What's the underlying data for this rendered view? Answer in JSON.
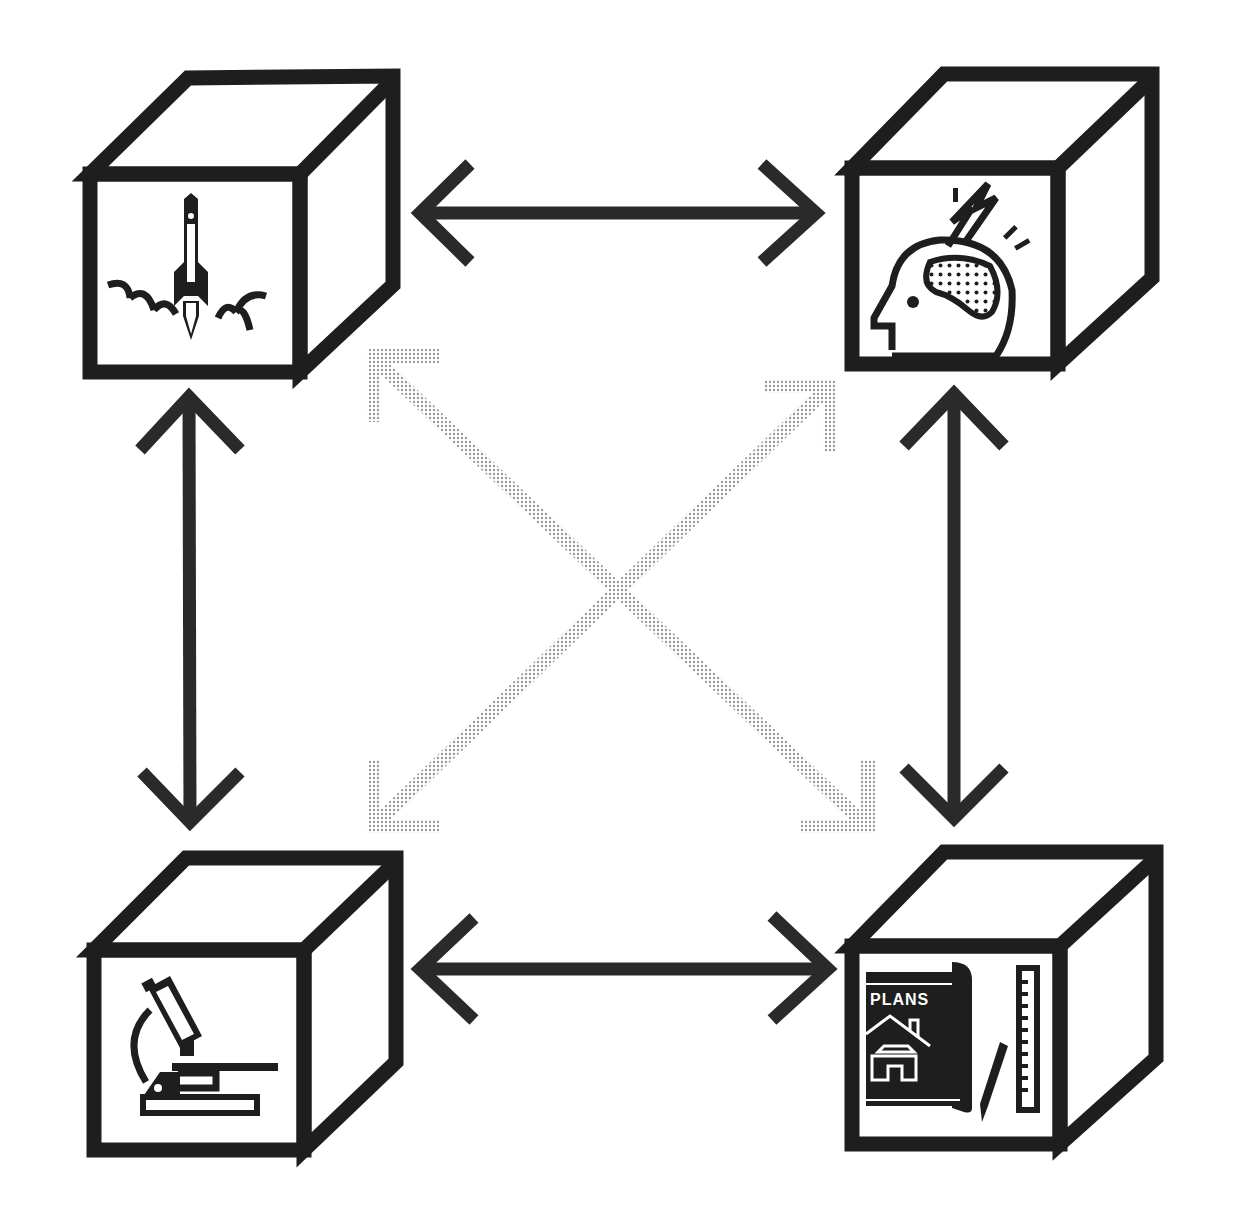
{
  "diagram": {
    "type": "four interconnected cubes",
    "background": "#ffffff",
    "colors": {
      "stroke": "#1e1e1e",
      "arrow": "#2a2a2a",
      "dotted_arrow": "#b0b0b0"
    },
    "nodes": [
      {
        "id": "top-left",
        "icon": "rocket-launch-icon"
      },
      {
        "id": "top-right",
        "icon": "head-brain-lightning-icon"
      },
      {
        "id": "bottom-left",
        "icon": "microscope-icon"
      },
      {
        "id": "bottom-right",
        "icon": "blueprint-plans-icon",
        "label": "PLANS"
      }
    ],
    "connections": [
      {
        "from": "top-left",
        "to": "top-right",
        "style": "solid",
        "direction": "bidirectional"
      },
      {
        "from": "bottom-left",
        "to": "bottom-right",
        "style": "solid",
        "direction": "bidirectional"
      },
      {
        "from": "top-left",
        "to": "bottom-left",
        "style": "solid",
        "direction": "bidirectional"
      },
      {
        "from": "top-right",
        "to": "bottom-right",
        "style": "solid",
        "direction": "bidirectional"
      },
      {
        "from": "top-left",
        "to": "bottom-right",
        "style": "dotted",
        "direction": "bidirectional"
      },
      {
        "from": "top-right",
        "to": "bottom-left",
        "style": "dotted",
        "direction": "bidirectional"
      }
    ]
  }
}
